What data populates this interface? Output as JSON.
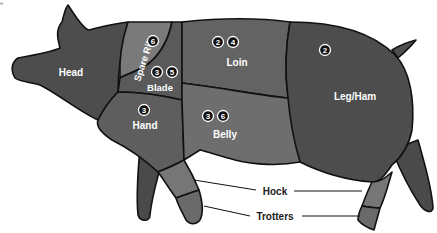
{
  "diagram": {
    "corner_text": "e",
    "colors": {
      "dark": "#4a4a4a",
      "mid": "#5e5e5e",
      "light": "#7a7a7a",
      "outline": "#111111",
      "label": "#ffffff"
    },
    "cuts": [
      {
        "name": "Head",
        "badges": []
      },
      {
        "name": "Spare Rib",
        "badges": [
          "6"
        ]
      },
      {
        "name": "Blade",
        "badges": [
          "3",
          "5"
        ]
      },
      {
        "name": "Loin",
        "badges": [
          "2",
          "4"
        ]
      },
      {
        "name": "Leg/Ham",
        "badges": [
          "2"
        ]
      },
      {
        "name": "Hand",
        "badges": [
          "3"
        ]
      },
      {
        "name": "Belly",
        "badges": [
          "3",
          "6"
        ]
      }
    ],
    "callouts": [
      {
        "name": "Hock"
      },
      {
        "name": "Trotters"
      }
    ]
  }
}
